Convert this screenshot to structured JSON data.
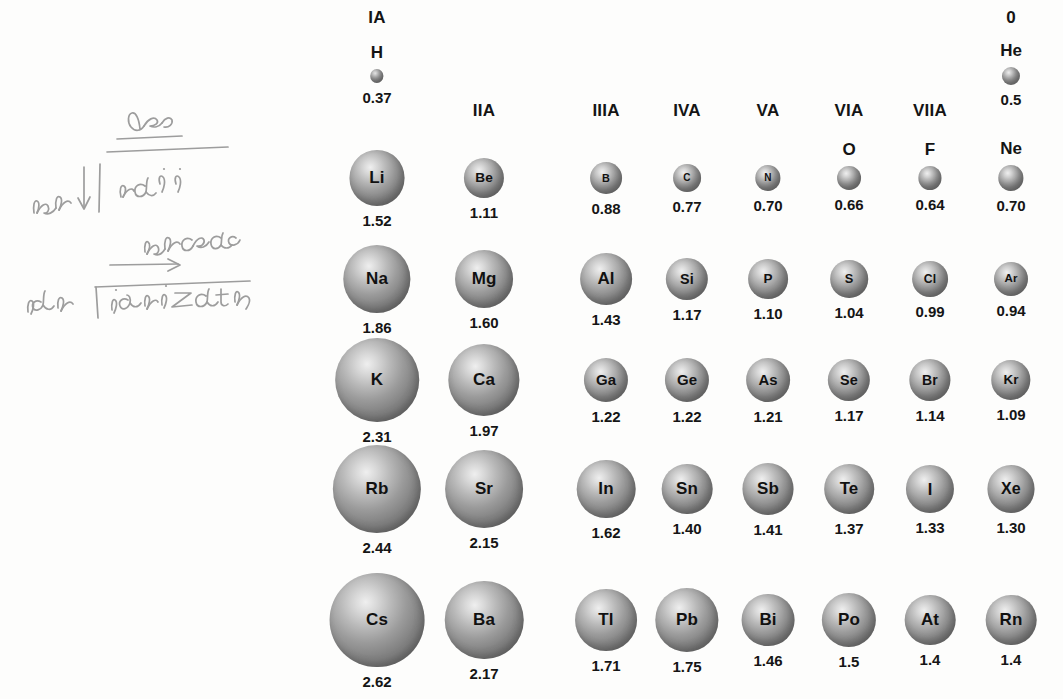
{
  "figure": {
    "unit": "angstrom",
    "scale_px_per_unit": 36.2
  },
  "group_headers": [
    {
      "label": "IA",
      "col": 0
    },
    {
      "label": "IIA",
      "col": 1
    },
    {
      "label": "IIIA",
      "col": 2
    },
    {
      "label": "IVA",
      "col": 3
    },
    {
      "label": "VA",
      "col": 4
    },
    {
      "label": "VIA",
      "col": 5
    },
    {
      "label": "VIIA",
      "col": 6
    },
    {
      "label": "0",
      "col": 7
    }
  ],
  "column_x": [
    377,
    484,
    606,
    687,
    768,
    849,
    930,
    1011
  ],
  "period_1": {
    "symbol_y": 42,
    "sphere_center_y": 76,
    "radius_y": 90
  },
  "periods": [
    {
      "name": "period-1",
      "symbol_y": 42,
      "sphere_center_y": 76,
      "radius_label_y": 90,
      "elements": [
        {
          "symbol": "H",
          "radius": "0.37",
          "value": 0.37,
          "col": 0,
          "label_position": "above"
        },
        {
          "symbol": "He",
          "radius": "0.5",
          "value": 0.5,
          "col": 7,
          "label_position": "above"
        }
      ]
    },
    {
      "name": "period-2",
      "symbol_y": 145,
      "sphere_center_y": 178,
      "radius_label_y": 199,
      "elements": [
        {
          "symbol": "Li",
          "radius": "1.52",
          "value": 1.52,
          "col": 0,
          "label_position": "inside"
        },
        {
          "symbol": "Be",
          "radius": "1.11",
          "value": 1.11,
          "col": 1,
          "label_position": "inside"
        },
        {
          "symbol": "B",
          "radius": "0.88",
          "value": 0.88,
          "col": 2,
          "label_position": "inside"
        },
        {
          "symbol": "C",
          "radius": "0.77",
          "value": 0.77,
          "col": 3,
          "label_position": "inside"
        },
        {
          "symbol": "N",
          "radius": "0.70",
          "value": 0.7,
          "col": 4,
          "label_position": "inside"
        },
        {
          "symbol": "O",
          "radius": "0.66",
          "value": 0.66,
          "col": 5,
          "label_position": "above"
        },
        {
          "symbol": "F",
          "radius": "0.64",
          "value": 0.64,
          "col": 6,
          "label_position": "above"
        },
        {
          "symbol": "Ne",
          "radius": "0.70",
          "value": 0.7,
          "col": 7,
          "label_position": "above"
        }
      ]
    },
    {
      "name": "period-3",
      "symbol_y": 0,
      "sphere_center_y": 279,
      "radius_label_y": 308,
      "elements": [
        {
          "symbol": "Na",
          "radius": "1.86",
          "value": 1.86,
          "col": 0,
          "label_position": "inside"
        },
        {
          "symbol": "Mg",
          "radius": "1.60",
          "value": 1.6,
          "col": 1,
          "label_position": "inside"
        },
        {
          "symbol": "Al",
          "radius": "1.43",
          "value": 1.43,
          "col": 2,
          "label_position": "inside"
        },
        {
          "symbol": "Si",
          "radius": "1.17",
          "value": 1.17,
          "col": 3,
          "label_position": "inside"
        },
        {
          "symbol": "P",
          "radius": "1.10",
          "value": 1.1,
          "col": 4,
          "label_position": "inside"
        },
        {
          "symbol": "S",
          "radius": "1.04",
          "value": 1.04,
          "col": 5,
          "label_position": "inside"
        },
        {
          "symbol": "Cl",
          "radius": "0.99",
          "value": 0.99,
          "col": 6,
          "label_position": "inside"
        },
        {
          "symbol": "Ar",
          "radius": "0.94",
          "value": 0.94,
          "col": 7,
          "label_position": "inside"
        }
      ]
    },
    {
      "name": "period-4",
      "symbol_y": 0,
      "sphere_center_y": 380,
      "radius_label_y": 413,
      "elements": [
        {
          "symbol": "K",
          "radius": "2.31",
          "value": 2.31,
          "col": 0,
          "label_position": "inside"
        },
        {
          "symbol": "Ca",
          "radius": "1.97",
          "value": 1.97,
          "col": 1,
          "label_position": "inside"
        },
        {
          "symbol": "Ga",
          "radius": "1.22",
          "value": 1.22,
          "col": 2,
          "label_position": "inside"
        },
        {
          "symbol": "Ge",
          "radius": "1.22",
          "value": 1.22,
          "col": 3,
          "label_position": "inside"
        },
        {
          "symbol": "As",
          "radius": "1.21",
          "value": 1.21,
          "col": 4,
          "label_position": "inside"
        },
        {
          "symbol": "Se",
          "radius": "1.17",
          "value": 1.17,
          "col": 5,
          "label_position": "inside"
        },
        {
          "symbol": "Br",
          "radius": "1.14",
          "value": 1.14,
          "col": 6,
          "label_position": "inside"
        },
        {
          "symbol": "Kr",
          "radius": "1.09",
          "value": 1.09,
          "col": 7,
          "label_position": "inside"
        }
      ]
    },
    {
      "name": "period-5",
      "symbol_y": 0,
      "sphere_center_y": 489,
      "radius_label_y": 529,
      "elements": [
        {
          "symbol": "Rb",
          "radius": "2.44",
          "value": 2.44,
          "col": 0,
          "label_position": "inside"
        },
        {
          "symbol": "Sr",
          "radius": "2.15",
          "value": 2.15,
          "col": 1,
          "label_position": "inside"
        },
        {
          "symbol": "In",
          "radius": "1.62",
          "value": 1.62,
          "col": 2,
          "label_position": "inside"
        },
        {
          "symbol": "Sn",
          "radius": "1.40",
          "value": 1.4,
          "col": 3,
          "label_position": "inside"
        },
        {
          "symbol": "Sb",
          "radius": "1.41",
          "value": 1.41,
          "col": 4,
          "label_position": "inside"
        },
        {
          "symbol": "Te",
          "radius": "1.37",
          "value": 1.37,
          "col": 5,
          "label_position": "inside"
        },
        {
          "symbol": "I",
          "radius": "1.33",
          "value": 1.33,
          "col": 6,
          "label_position": "inside"
        },
        {
          "symbol": "Xe",
          "radius": "1.30",
          "value": 1.3,
          "col": 7,
          "label_position": "inside"
        }
      ]
    },
    {
      "name": "period-6",
      "symbol_y": 0,
      "sphere_center_y": 620,
      "radius_label_y": 665,
      "elements": [
        {
          "symbol": "Cs",
          "radius": "2.62",
          "value": 2.62,
          "col": 0,
          "label_position": "inside"
        },
        {
          "symbol": "Ba",
          "radius": "2.17",
          "value": 2.17,
          "col": 1,
          "label_position": "inside"
        },
        {
          "symbol": "Tl",
          "radius": "1.71",
          "value": 1.71,
          "col": 2,
          "label_position": "inside"
        },
        {
          "symbol": "Pb",
          "radius": "1.75",
          "value": 1.75,
          "col": 3,
          "label_position": "inside"
        },
        {
          "symbol": "Bi",
          "radius": "1.46",
          "value": 1.46,
          "col": 4,
          "label_position": "inside"
        },
        {
          "symbol": "Po",
          "radius": "1.5",
          "value": 1.5,
          "col": 5,
          "label_position": "inside"
        },
        {
          "symbol": "At",
          "radius": "1.4",
          "value": 1.4,
          "col": 6,
          "label_position": "inside"
        },
        {
          "symbol": "Rn",
          "radius": "1.4",
          "value": 1.4,
          "col": 7,
          "label_position": "inside"
        }
      ]
    }
  ],
  "annotations": {
    "dec_label": "dec",
    "incr_label": "incr",
    "radii_label": "radii",
    "increas_label": "increas",
    "decr_label": "decr",
    "ionization_label": "ionizatn",
    "pencil_color": "#9a9a9a"
  },
  "chart_data": {
    "type": "bar",
    "xlabel": "Group",
    "ylabel": "Atomic radius",
    "categories": [
      "IA",
      "IIA",
      "IIIA",
      "IVA",
      "VA",
      "VIA",
      "VIIA",
      "0"
    ],
    "series": [
      {
        "name": "Period 1",
        "labels": [
          "H",
          "",
          "",
          "",
          "",
          "",
          "",
          "He"
        ],
        "values": [
          0.37,
          null,
          null,
          null,
          null,
          null,
          null,
          0.5
        ]
      },
      {
        "name": "Period 2",
        "labels": [
          "Li",
          "Be",
          "B",
          "C",
          "N",
          "O",
          "F",
          "Ne"
        ],
        "values": [
          1.52,
          1.11,
          0.88,
          0.77,
          0.7,
          0.66,
          0.64,
          0.7
        ]
      },
      {
        "name": "Period 3",
        "labels": [
          "Na",
          "Mg",
          "Al",
          "Si",
          "P",
          "S",
          "Cl",
          "Ar"
        ],
        "values": [
          1.86,
          1.6,
          1.43,
          1.17,
          1.1,
          1.04,
          0.99,
          0.94
        ]
      },
      {
        "name": "Period 4",
        "labels": [
          "K",
          "Ca",
          "Ga",
          "Ge",
          "As",
          "Se",
          "Br",
          "Kr"
        ],
        "values": [
          2.31,
          1.97,
          1.22,
          1.22,
          1.21,
          1.17,
          1.14,
          1.09
        ]
      },
      {
        "name": "Period 5",
        "labels": [
          "Rb",
          "Sr",
          "In",
          "Sn",
          "Sb",
          "Te",
          "I",
          "Xe"
        ],
        "values": [
          2.44,
          2.15,
          1.62,
          1.4,
          1.41,
          1.37,
          1.33,
          1.3
        ]
      },
      {
        "name": "Period 6",
        "labels": [
          "Cs",
          "Ba",
          "Tl",
          "Pb",
          "Bi",
          "Po",
          "At",
          "Rn"
        ],
        "values": [
          2.62,
          2.17,
          1.71,
          1.75,
          1.46,
          1.5,
          1.4,
          1.4
        ]
      }
    ],
    "ylim": [
      0,
      2.62
    ],
    "grid": false,
    "legend": "none",
    "encoding": "circle area/diameter proportional to atomic radius"
  }
}
